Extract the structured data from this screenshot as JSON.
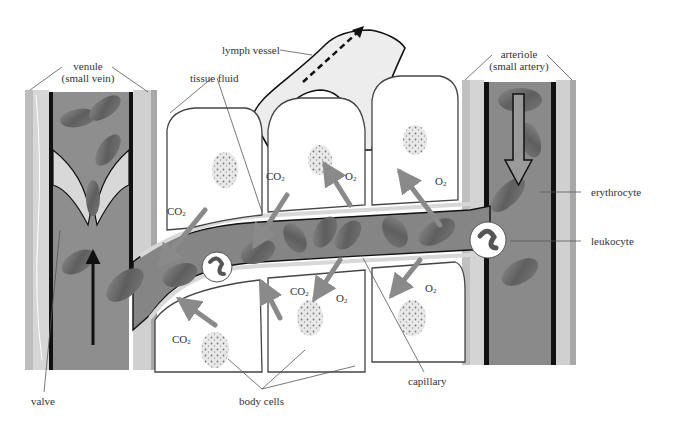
{
  "diagram": {
    "colors": {
      "blood_plasma": "#8a8a8a",
      "vessel_wall_dark": "#1a1a1a",
      "vessel_wall_light": "#d8d8d8",
      "erythrocyte": "#6e6e6e",
      "lymph": "#ededed",
      "cell_interior": "#ffffff",
      "arrow_gray": "#7a7a7a",
      "label_text": "#333333"
    },
    "labels": {
      "venule_line1": "venule",
      "venule_line2": "(small vein)",
      "lymph_vessel": "lymph vessel",
      "tissue_fluid": "tissue fluid",
      "arteriole_line1": "arteriole",
      "arteriole_line2": "(small artery)",
      "erythrocyte": "erythrocyte",
      "leukocyte": "leukocyte",
      "valve": "valve",
      "body_cells": "body cells",
      "capillary": "capillary"
    },
    "gas_labels": [
      {
        "id": "co2-1",
        "base": "CO",
        "sub": "2",
        "x": 167,
        "y": 205
      },
      {
        "id": "co2-2",
        "base": "CO",
        "sub": "2",
        "x": 266,
        "y": 170
      },
      {
        "id": "o2-1",
        "base": "O",
        "sub": "2",
        "x": 345,
        "y": 170
      },
      {
        "id": "o2-2",
        "base": "O",
        "sub": "2",
        "x": 435,
        "y": 175
      },
      {
        "id": "co2-3",
        "base": "CO",
        "sub": "2",
        "x": 290,
        "y": 285
      },
      {
        "id": "o2-3",
        "base": "O",
        "sub": "2",
        "x": 336,
        "y": 292
      },
      {
        "id": "o2-4",
        "base": "O",
        "sub": "2",
        "x": 425,
        "y": 282
      },
      {
        "id": "co2-4",
        "base": "CO",
        "sub": "2",
        "x": 172,
        "y": 333
      }
    ],
    "flow": {
      "venule_direction": "up",
      "arteriole_direction": "down",
      "lymph_direction": "up-right"
    }
  }
}
